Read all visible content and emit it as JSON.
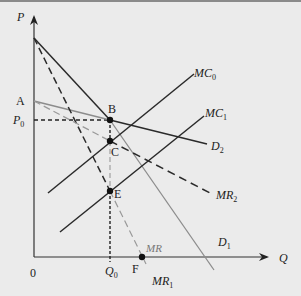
{
  "diagram": {
    "type": "kinked-demand-economics",
    "axes": {
      "y_label": "P",
      "x_label": "Q",
      "origin_label": "0"
    },
    "points": {
      "A": "A",
      "B": "B",
      "C": "C",
      "E": "E",
      "F": "F"
    },
    "levels": {
      "p0_main": "P",
      "p0_sub": "0",
      "q0_main": "Q",
      "q0_sub": "0"
    },
    "curves": {
      "mc0_main": "MC",
      "mc0_sub": "0",
      "mc1_main": "MC",
      "mc1_sub": "1",
      "d2_main": "D",
      "d2_sub": "2",
      "d1_main": "D",
      "d1_sub": "1",
      "mr2_main": "MR",
      "mr2_sub": "2",
      "mr1_main": "MR",
      "mr1_sub": "1",
      "mr_label": "MR"
    },
    "colors": {
      "background": "#ebebeb",
      "dark_line": "#2a2a2a",
      "gray_line": "#8c8c8c"
    }
  }
}
